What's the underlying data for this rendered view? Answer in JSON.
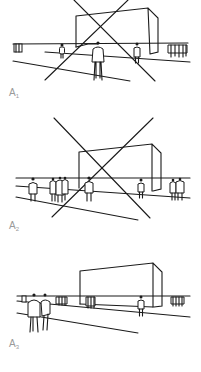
{
  "figure": {
    "panels": [
      {
        "id": "A1",
        "label_main": "A",
        "label_sub": "1",
        "has_cross_lines": true
      },
      {
        "id": "A2",
        "label_main": "A",
        "label_sub": "2",
        "has_cross_lines": true
      },
      {
        "id": "A3",
        "label_main": "A",
        "label_sub": "3",
        "has_cross_lines": false
      }
    ],
    "colors": {
      "ink": "#1a1a1a",
      "label": "#9a9a9a",
      "background": "#ffffff"
    }
  }
}
